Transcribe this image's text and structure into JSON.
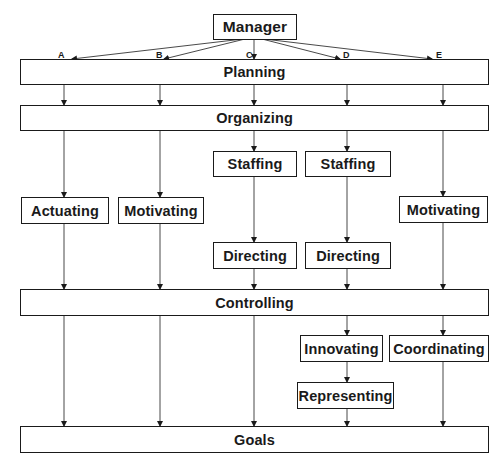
{
  "diagram": {
    "root": "Manager",
    "branches": [
      "A",
      "B",
      "C",
      "D",
      "E"
    ],
    "levels": {
      "planning": "Planning",
      "organizing": "Organizing",
      "controlling": "Controlling",
      "goals": "Goals"
    },
    "nodes": {
      "actuating": "Actuating",
      "motivating_b": "Motivating",
      "staffing_c": "Staffing",
      "staffing_d": "Staffing",
      "motivating_e": "Motivating",
      "directing_c": "Directing",
      "directing_d": "Directing",
      "innovating": "Innovating",
      "coordinating": "Coordinating",
      "representing": "Representing"
    },
    "paths": {
      "A": [
        "Manager",
        "Planning",
        "Organizing",
        "Actuating",
        "Controlling",
        "Goals"
      ],
      "B": [
        "Manager",
        "Planning",
        "Organizing",
        "Motivating",
        "Controlling",
        "Goals"
      ],
      "C": [
        "Manager",
        "Planning",
        "Organizing",
        "Staffing",
        "Directing",
        "Controlling",
        "Goals"
      ],
      "D": [
        "Manager",
        "Planning",
        "Organizing",
        "Staffing",
        "Directing",
        "Controlling",
        "Innovating",
        "Representing",
        "Goals"
      ],
      "E": [
        "Manager",
        "Planning",
        "Organizing",
        "Motivating",
        "Controlling",
        "Coordinating",
        "Goals"
      ]
    },
    "colors": {
      "line": "#1a1a1a",
      "background": "#ffffff"
    }
  }
}
